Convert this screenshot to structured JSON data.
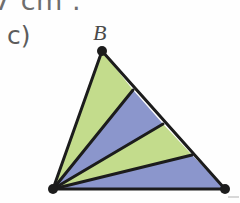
{
  "page": {
    "width": 240,
    "height": 203,
    "background_color": "#fefefe",
    "top_text_fragment": "7 cm .",
    "problem_label": "c)"
  },
  "figure": {
    "type": "triangle-sector-fan",
    "vertex_labels": [
      {
        "name": "B",
        "text": "B",
        "x": 102,
        "y": 51,
        "label_x": 93,
        "label_y": 22
      }
    ],
    "vertices": {
      "A": {
        "x": 53,
        "y": 189
      },
      "B": {
        "x": 102,
        "y": 51
      },
      "C": {
        "x": 225,
        "y": 189
      }
    },
    "vertex_dots": [
      {
        "name": "dot-b",
        "x": 102,
        "y": 51,
        "r": 5
      },
      {
        "name": "dot-a",
        "x": 53,
        "y": 189,
        "r": 5
      },
      {
        "name": "dot-c",
        "x": 225,
        "y": 189,
        "r": 5
      }
    ],
    "division_points_on_bc": [
      {
        "name": "division-point-1",
        "x": 133,
        "y": 90
      },
      {
        "name": "division-point-2",
        "x": 163,
        "y": 124
      },
      {
        "name": "division-point-3",
        "x": 192,
        "y": 155
      }
    ],
    "sectors": [
      {
        "name": "sector-1",
        "fill": "#c3dc8c",
        "color_name": "green",
        "points": "102,51 133,90 53,189"
      },
      {
        "name": "sector-2",
        "fill": "#8b96cc",
        "color_name": "blue",
        "points": "133,90 163,124 53,189"
      },
      {
        "name": "sector-3",
        "fill": "#c3dc8c",
        "color_name": "green",
        "points": "163,124 192,155 53,189"
      },
      {
        "name": "sector-4",
        "fill": "#8b96cc",
        "color_name": "blue",
        "points": "192,155 225,189 53,189"
      }
    ],
    "colors": {
      "green": "#c3dc8c",
      "blue": "#8b96cc",
      "outline": "#1c1c1c",
      "text": "#5c5c5c",
      "label": "#4a4a4a"
    },
    "outline_width": 3,
    "cevian_width": 3
  }
}
